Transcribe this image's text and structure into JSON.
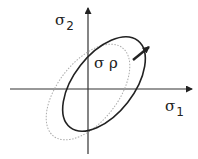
{
  "diagram": {
    "type": "stress-space yield surface",
    "axes": {
      "x": {
        "symbol": "σ",
        "subscript": "1"
      },
      "y": {
        "symbol": "σ",
        "subscript": "2"
      }
    },
    "annotation": {
      "label": "σ ρ"
    },
    "curves": [
      {
        "name": "translated-yield-ellipse",
        "style": "solid",
        "color": "#222222"
      },
      {
        "name": "initial-yield-ellipse",
        "style": "dotted",
        "color": "#aaaaaa"
      }
    ],
    "arrow": {
      "description": "back-stress translation vector",
      "color": "#222222"
    }
  }
}
